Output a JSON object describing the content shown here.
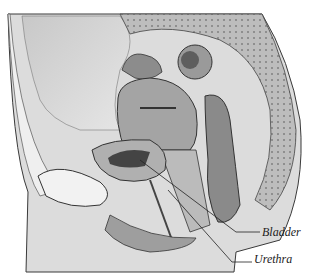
{
  "figure": {
    "type": "anatomical-illustration",
    "view": "sagittal section of female pelvis",
    "labels": [
      {
        "text": "Bladder",
        "x": 262,
        "y": 225
      },
      {
        "text": "Urethra",
        "x": 254,
        "y": 252
      }
    ],
    "colors": {
      "background": "#ffffff",
      "line": "#3a3a3a",
      "skin": "#d9d9d9",
      "tissue_dark": "#6e6e6e",
      "tissue_mid": "#a8a8a8"
    }
  }
}
